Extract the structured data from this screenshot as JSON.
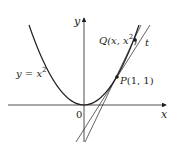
{
  "diagram": {
    "type": "function-graph",
    "curve": {
      "equation_label_lhs": "y = x",
      "equation_label_exp": "2"
    },
    "axes": {
      "x_label": "x",
      "y_label": "y",
      "origin_label": "0"
    },
    "points": {
      "P": {
        "name": "P",
        "coords": "(1, 1)"
      },
      "Q": {
        "name": "Q",
        "coords_prefix": "(x, x",
        "coords_exp": "2",
        "coords_suffix": ")"
      }
    },
    "tangent_label": "t",
    "colors": {
      "ink": "#231f20",
      "background": "#ffffff"
    }
  }
}
